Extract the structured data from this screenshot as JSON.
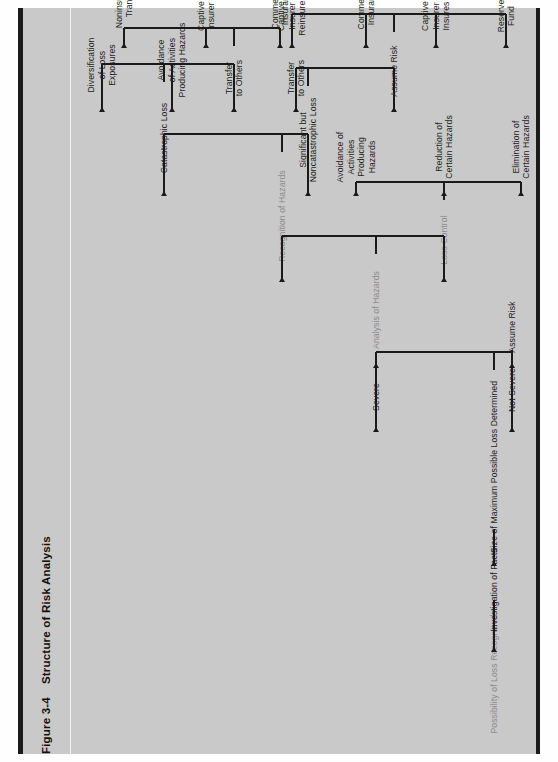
{
  "figure": {
    "number": "Figure 3-4",
    "title": "Structure of Risk Analysis"
  },
  "colors": {
    "page_background": "#c9c9c9",
    "rule": "#1b1b1b",
    "node_text": "#1d1d1d",
    "stage_label_text": "#8c8c8c",
    "connector": "#1a1a1a"
  },
  "chart_data": {
    "type": "diagram",
    "title": "Structure of Risk Analysis",
    "orientation": "rotated-90-ccw (left-to-right flow reads bottom-to-top on the page)",
    "nodes": [
      {
        "id": "n01",
        "label": "Possibility of Loss Recognized",
        "style": "stage"
      },
      {
        "id": "n02",
        "label": "Investigation of Facts",
        "style": "node"
      },
      {
        "id": "n03",
        "label": "Size of Maximum Possible Loss Determined",
        "style": "node"
      },
      {
        "id": "n04",
        "label": "Severe",
        "style": "node"
      },
      {
        "id": "n05",
        "label": "Not Severe",
        "style": "node"
      },
      {
        "id": "n06",
        "label": "Analysis of Hazards",
        "style": "stage"
      },
      {
        "id": "n07",
        "label": "Assume Risk",
        "style": "node"
      },
      {
        "id": "n08",
        "label": "Loss Control",
        "style": "stage"
      },
      {
        "id": "n09",
        "label": "Recognition of Hazards",
        "style": "stage"
      },
      {
        "id": "n10",
        "label": "Elimination of\nCertain Hazards",
        "style": "node"
      },
      {
        "id": "n11",
        "label": "Reduction of\nCertain Hazards",
        "style": "node"
      },
      {
        "id": "n12",
        "label": "Avoidance of\nActivities\nProducing\nHazards",
        "style": "node"
      },
      {
        "id": "n13",
        "label": "Catastrophic Loss",
        "style": "node"
      },
      {
        "id": "n14",
        "label": "Significant but\nNoncatastrophic Loss",
        "style": "node"
      },
      {
        "id": "n15",
        "label": "Transfer\nto Others",
        "style": "node"
      },
      {
        "id": "n16",
        "label": "Avoidance\nof Activities\nProducing Hazards",
        "style": "node"
      },
      {
        "id": "n17",
        "label": "Diversification\nof Loss\nExposures",
        "style": "node"
      },
      {
        "id": "n18",
        "label": "Commercial\nInsurance",
        "style": "node"
      },
      {
        "id": "n19",
        "label": "Captive\nInsurer",
        "style": "node"
      },
      {
        "id": "n20",
        "label": "Noninsurance\nTransfer",
        "style": "node"
      },
      {
        "id": "n21",
        "label": "Reinsurance",
        "style": "node"
      },
      {
        "id": "n22",
        "label": "Transfer\nto Others",
        "style": "node"
      },
      {
        "id": "n23",
        "label": "Assume Risk",
        "style": "node"
      },
      {
        "id": "n24",
        "label": "Reserve\nFund",
        "style": "node"
      },
      {
        "id": "n25",
        "label": "Captive\nInsurer\nInsures",
        "style": "node"
      },
      {
        "id": "n26",
        "label": "Commercial\nInsurance",
        "style": "node"
      },
      {
        "id": "n27",
        "label": "Captive\nInsurer\nReinsures",
        "style": "node"
      }
    ],
    "edges": [
      {
        "from": "n01",
        "to": "n02"
      },
      {
        "from": "n02",
        "to": "n03"
      },
      {
        "from": "n03",
        "to": "n04"
      },
      {
        "from": "n03",
        "to": "n05"
      },
      {
        "from": "n04",
        "to": "n06"
      },
      {
        "from": "n05",
        "to": "n07"
      },
      {
        "from": "n06",
        "to": "n08"
      },
      {
        "from": "n06",
        "to": "n09"
      },
      {
        "from": "n08",
        "to": "n10"
      },
      {
        "from": "n08",
        "to": "n11"
      },
      {
        "from": "n08",
        "to": "n12"
      },
      {
        "from": "n09",
        "to": "n13"
      },
      {
        "from": "n09",
        "to": "n14"
      },
      {
        "from": "n13",
        "to": "n15"
      },
      {
        "from": "n13",
        "to": "n16"
      },
      {
        "from": "n13",
        "to": "n17"
      },
      {
        "from": "n15",
        "to": "n18"
      },
      {
        "from": "n15",
        "to": "n19"
      },
      {
        "from": "n15",
        "to": "n20"
      },
      {
        "from": "n19",
        "to": "n21"
      },
      {
        "from": "n14",
        "to": "n22"
      },
      {
        "from": "n14",
        "to": "n23"
      },
      {
        "from": "n23",
        "to": "n24"
      },
      {
        "from": "n23",
        "to": "n25"
      },
      {
        "from": "n23",
        "to": "n26"
      },
      {
        "from": "n23",
        "to": "n27"
      }
    ]
  }
}
